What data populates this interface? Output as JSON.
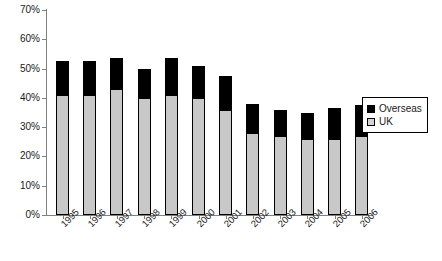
{
  "chart_data": {
    "type": "bar",
    "subtype": "stacked-bar",
    "title": "",
    "subtitle": "",
    "xlabel": "",
    "ylabel": "",
    "categories": [
      "1995",
      "1996",
      "1997",
      "1998",
      "1999",
      "2000",
      "2001",
      "2002",
      "2003",
      "2004",
      "2005",
      "2006"
    ],
    "series": [
      {
        "name": "UK",
        "color": "#c8c8c8",
        "values": [
          41,
          41,
          43,
          40,
          41,
          40,
          36,
          28,
          27,
          26,
          26,
          27
        ]
      },
      {
        "name": "Overseas",
        "color": "#000000",
        "values": [
          11.5,
          11.5,
          10.5,
          10,
          12.5,
          11,
          11.5,
          10,
          9,
          9,
          10.5,
          10.5
        ]
      }
    ],
    "totals": [
      52.5,
      52.5,
      53.5,
      50,
      53.5,
      51,
      47.5,
      38,
      36,
      35,
      36.5,
      37.5
    ],
    "ylim": [
      0,
      70
    ],
    "ytick_values": [
      0,
      10,
      20,
      30,
      40,
      50,
      60,
      70
    ],
    "ytick_labels": [
      "0%",
      "10%",
      "20%",
      "30%",
      "40%",
      "50%",
      "60%",
      "70%"
    ],
    "grid": false,
    "legend_position": "right",
    "legend_entries": [
      {
        "label": "Overseas",
        "swatch": "black-square"
      },
      {
        "label": "UK",
        "swatch": "light-gray-square"
      }
    ]
  }
}
